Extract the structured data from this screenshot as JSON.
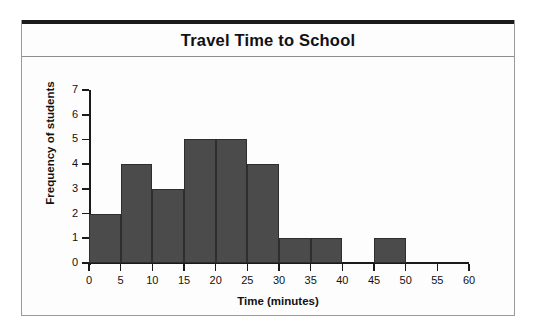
{
  "figure": {
    "title": "Travel Time to School"
  },
  "chart_data": {
    "type": "bar",
    "title": "Travel Time to School",
    "xlabel": "Time (minutes)",
    "ylabel": "Frequency of students",
    "xlim": [
      0,
      60
    ],
    "ylim": [
      0,
      7
    ],
    "bin_width": 5,
    "grid": false,
    "legend": null,
    "x_ticks": [
      "0",
      "5",
      "10",
      "15",
      "20",
      "25",
      "30",
      "35",
      "40",
      "45",
      "50",
      "55",
      "60"
    ],
    "y_ticks": [
      "0",
      "1",
      "2",
      "3",
      "4",
      "5",
      "6",
      "7"
    ],
    "bar_color": "#4b4b4b",
    "categories": [
      "0-5",
      "5-10",
      "10-15",
      "15-20",
      "20-25",
      "25-30",
      "30-35",
      "35-40",
      "40-45",
      "45-50",
      "50-55",
      "55-60"
    ],
    "bin_starts": [
      0,
      5,
      10,
      15,
      20,
      25,
      30,
      35,
      40,
      45,
      50,
      55
    ],
    "values": [
      2,
      4,
      3,
      5,
      5,
      4,
      1,
      1,
      0,
      1,
      0,
      0
    ]
  }
}
